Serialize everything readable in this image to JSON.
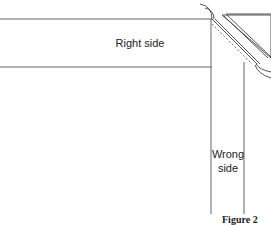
{
  "diagram": {
    "labels": {
      "right_side": "Right side",
      "wrong_side_line1": "Wrong",
      "wrong_side_line2": "side"
    },
    "caption": "Figure 2",
    "colors": {
      "line": "#555555",
      "background": "#ffffff"
    }
  }
}
